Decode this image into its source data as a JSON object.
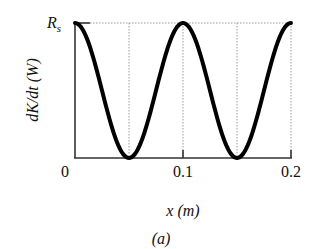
{
  "chart_data": {
    "type": "line",
    "title": "",
    "xlabel": "x (m)",
    "ylabel": "dK/dt (W)",
    "caption": "(a)",
    "x_ticks": [
      "0",
      "0.1",
      "0.2"
    ],
    "y_ticks": [
      "R_s"
    ],
    "y_tick_main": "R",
    "y_tick_sub": "s",
    "xlim": [
      0,
      0.2
    ],
    "ylim": [
      0,
      1
    ],
    "grid": "dotted vertical lines at x = 0.05, 0.1, 0.15, 0.2 and dotted horizontal line at y = R_s",
    "legend": null,
    "series": [
      {
        "name": "dK/dt",
        "description": "cos^2 shaped curve with maxima R_s at x = 0, 0.1, 0.2 and zeros at x = 0.05, 0.15",
        "x": [
          0,
          0.025,
          0.05,
          0.075,
          0.1,
          0.125,
          0.15,
          0.175,
          0.2
        ],
        "values": [
          1,
          0.5,
          0,
          0.5,
          1,
          0.5,
          0,
          0.5,
          1
        ]
      }
    ]
  }
}
